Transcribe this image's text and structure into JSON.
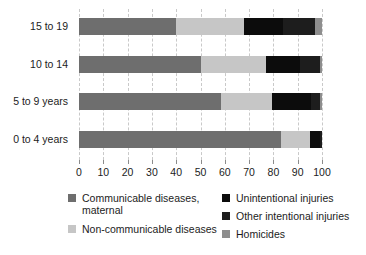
{
  "chart_data": {
    "type": "bar",
    "orientation": "horizontal",
    "stacked": true,
    "normalized": "percent",
    "title": "",
    "subtitle": "",
    "xlabel": "",
    "ylabel": "",
    "xlim": [
      0,
      100
    ],
    "xticks": [
      0,
      10,
      20,
      30,
      40,
      50,
      60,
      70,
      80,
      90,
      100
    ],
    "xtick_labels": [
      "0",
      "10",
      "20",
      "30",
      "40",
      "50",
      "60",
      "70",
      "80",
      "90",
      "100"
    ],
    "grid": "vertical-dashed",
    "legend_position": "bottom",
    "categories": [
      "15 to 19",
      "10 to 14",
      "5 to 9 years",
      "0 to 4 years"
    ],
    "series": [
      {
        "name": "Communicable diseases, maternal",
        "color": "#6e6e6e",
        "values": [
          40,
          50,
          58.5,
          83
        ]
      },
      {
        "name": "Non-communicable diseases",
        "color": "#c6c6c6",
        "values": [
          28,
          27,
          21,
          12
        ]
      },
      {
        "name": "Unintentional injuries",
        "color": "#0c0c0c",
        "values": [
          16,
          14,
          16,
          4
        ]
      },
      {
        "name": "Other intentional injuries",
        "color": "#1d1d1d",
        "values": [
          13,
          8,
          3.5,
          1
        ]
      },
      {
        "name": "Homicides",
        "color": "#8e8e8e",
        "values": [
          3,
          1,
          1,
          0
        ]
      }
    ]
  },
  "axis": {
    "y_labels": [
      "15 to 19",
      "10 to 14",
      "5 to 9 years",
      "0 to 4 years"
    ],
    "x_labels": [
      "0",
      "10",
      "20",
      "30",
      "40",
      "50",
      "60",
      "70",
      "80",
      "90",
      "100"
    ]
  },
  "legend": {
    "left_column": [
      {
        "label": "Communicable diseases, maternal",
        "swatch_name": "legend-swatch-communicable",
        "color": "#6e6e6e"
      },
      {
        "label": "Non-communicable diseases",
        "swatch_name": "legend-swatch-non-communicable",
        "color": "#c6c6c6"
      }
    ],
    "right_column": [
      {
        "label": "Unintentional injuries",
        "swatch_name": "legend-swatch-unintentional",
        "color": "#0c0c0c"
      },
      {
        "label": "Other intentional injuries",
        "swatch_name": "legend-swatch-other-intentional",
        "color": "#1d1d1d"
      },
      {
        "label": "Homicides",
        "swatch_name": "legend-swatch-homicides",
        "color": "#8e8e8e"
      }
    ]
  },
  "colors": {
    "communicable": "#6e6e6e",
    "non_communicable": "#c6c6c6",
    "unintentional": "#0c0c0c",
    "other_intentional": "#1d1d1d",
    "homicides": "#8e8e8e",
    "gridline": "#c9c9c9",
    "text": "#1c1c1c",
    "background": "#ffffff"
  }
}
